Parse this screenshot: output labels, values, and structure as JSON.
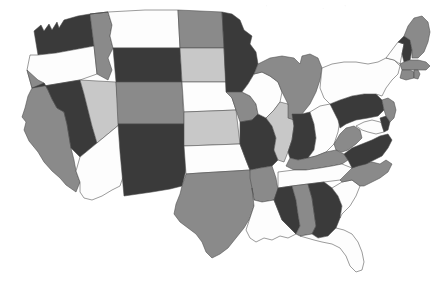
{
  "figure": {
    "type": "choropleth-map",
    "region": "United States (contiguous 48 states)",
    "projection_note": "simplified rectilinear state outlines",
    "background_color": "#ffffff",
    "border_color": "#4a4a4a"
  },
  "legend": {
    "visible": false,
    "categories": [
      {
        "key": "dark",
        "label": "Dark",
        "color": "#3a3a3a"
      },
      {
        "key": "medium",
        "label": "Medium gray",
        "color": "#8a8a8a"
      },
      {
        "key": "light",
        "label": "Light gray",
        "color": "#c8c8c8"
      },
      {
        "key": "white",
        "label": "White",
        "color": "#fdfdfd"
      }
    ]
  },
  "chart_data": {
    "type": "heatmap",
    "title": "",
    "xlabel": "",
    "ylabel": "",
    "categories": [
      "dark",
      "medium",
      "light",
      "white"
    ],
    "category_colors": {
      "dark": "#3a3a3a",
      "medium": "#8a8a8a",
      "light": "#c8c8c8",
      "white": "#fdfdfd"
    },
    "states": [
      {
        "code": "WA",
        "name": "Washington",
        "category": "dark"
      },
      {
        "code": "OR",
        "name": "Oregon",
        "category": "white"
      },
      {
        "code": "CA",
        "name": "California",
        "category": "medium"
      },
      {
        "code": "NV",
        "name": "Nevada",
        "category": "dark"
      },
      {
        "code": "ID",
        "name": "Idaho",
        "category": "medium"
      },
      {
        "code": "MT",
        "name": "Montana",
        "category": "white"
      },
      {
        "code": "WY",
        "name": "Wyoming",
        "category": "dark"
      },
      {
        "code": "UT",
        "name": "Utah",
        "category": "light"
      },
      {
        "code": "AZ",
        "name": "Arizona",
        "category": "white"
      },
      {
        "code": "CO",
        "name": "Colorado",
        "category": "medium"
      },
      {
        "code": "NM",
        "name": "New Mexico",
        "category": "dark"
      },
      {
        "code": "ND",
        "name": "North Dakota",
        "category": "medium"
      },
      {
        "code": "SD",
        "name": "South Dakota",
        "category": "light"
      },
      {
        "code": "NE",
        "name": "Nebraska",
        "category": "white"
      },
      {
        "code": "KS",
        "name": "Kansas",
        "category": "light"
      },
      {
        "code": "OK",
        "name": "Oklahoma",
        "category": "white"
      },
      {
        "code": "TX",
        "name": "Texas",
        "category": "medium"
      },
      {
        "code": "MN",
        "name": "Minnesota",
        "category": "dark"
      },
      {
        "code": "IA",
        "name": "Iowa",
        "category": "medium"
      },
      {
        "code": "MO",
        "name": "Missouri",
        "category": "dark"
      },
      {
        "code": "AR",
        "name": "Arkansas",
        "category": "medium"
      },
      {
        "code": "LA",
        "name": "Louisiana",
        "category": "white"
      },
      {
        "code": "WI",
        "name": "Wisconsin",
        "category": "white"
      },
      {
        "code": "IL",
        "name": "Illinois",
        "category": "light"
      },
      {
        "code": "MI",
        "name": "Michigan",
        "category": "medium"
      },
      {
        "code": "IN",
        "name": "Indiana",
        "category": "dark"
      },
      {
        "code": "OH",
        "name": "Ohio",
        "category": "white"
      },
      {
        "code": "KY",
        "name": "Kentucky",
        "category": "medium"
      },
      {
        "code": "TN",
        "name": "Tennessee",
        "category": "white"
      },
      {
        "code": "MS",
        "name": "Mississippi",
        "category": "dark"
      },
      {
        "code": "AL",
        "name": "Alabama",
        "category": "medium"
      },
      {
        "code": "GA",
        "name": "Georgia",
        "category": "dark"
      },
      {
        "code": "FL",
        "name": "Florida",
        "category": "white"
      },
      {
        "code": "SC",
        "name": "South Carolina",
        "category": "white"
      },
      {
        "code": "NC",
        "name": "North Carolina",
        "category": "medium"
      },
      {
        "code": "VA",
        "name": "Virginia",
        "category": "dark"
      },
      {
        "code": "WV",
        "name": "West Virginia",
        "category": "medium"
      },
      {
        "code": "MD",
        "name": "Maryland",
        "category": "white"
      },
      {
        "code": "DE",
        "name": "Delaware",
        "category": "dark"
      },
      {
        "code": "PA",
        "name": "Pennsylvania",
        "category": "dark"
      },
      {
        "code": "NJ",
        "name": "New Jersey",
        "category": "medium"
      },
      {
        "code": "NY",
        "name": "New York",
        "category": "white"
      },
      {
        "code": "CT",
        "name": "Connecticut",
        "category": "medium"
      },
      {
        "code": "RI",
        "name": "Rhode Island",
        "category": "medium"
      },
      {
        "code": "MA",
        "name": "Massachusetts",
        "category": "medium"
      },
      {
        "code": "VT",
        "name": "Vermont",
        "category": "white"
      },
      {
        "code": "NH",
        "name": "New Hampshire",
        "category": "dark"
      },
      {
        "code": "ME",
        "name": "Maine",
        "category": "medium"
      }
    ]
  }
}
